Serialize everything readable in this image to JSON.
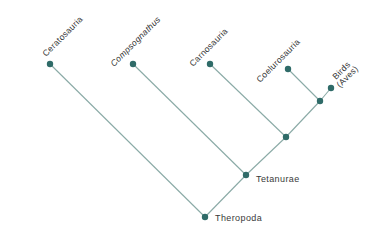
{
  "diagram": {
    "type": "cladogram",
    "colors": {
      "edge": "#8aaaa6",
      "node": "#2f6b68",
      "text": "#333333"
    },
    "tips": [
      {
        "id": "ceratosauria",
        "label": "Ceratosauria",
        "italic": false,
        "x": 50,
        "y": 64
      },
      {
        "id": "compsognathus",
        "label": "Compsognathus",
        "italic": true,
        "x": 133,
        "y": 64
      },
      {
        "id": "carnosauria",
        "label": "Carnosauria",
        "italic": false,
        "x": 210,
        "y": 64
      },
      {
        "id": "coelurosauria",
        "label": "Coelurosauria",
        "italic": false,
        "x": 288,
        "y": 69
      },
      {
        "id": "birds",
        "label": "Birds",
        "label2": "(Aves)",
        "italic": false,
        "x": 331,
        "y": 88
      }
    ],
    "internal_nodes": [
      {
        "id": "coel-birds",
        "label": "",
        "x": 320,
        "y": 101
      },
      {
        "id": "carno-clade",
        "label": "",
        "x": 286,
        "y": 137
      },
      {
        "id": "tetanurae",
        "label": "Tetanurae",
        "x": 246,
        "y": 175
      },
      {
        "id": "theropoda",
        "label": "Theropoda",
        "x": 205,
        "y": 217
      }
    ],
    "edges": [
      [
        "ceratosauria",
        "theropoda"
      ],
      [
        "tetanurae",
        "theropoda"
      ],
      [
        "compsognathus",
        "tetanurae"
      ],
      [
        "carno-clade",
        "tetanurae"
      ],
      [
        "carnosauria",
        "carno-clade"
      ],
      [
        "coel-birds",
        "carno-clade"
      ],
      [
        "coelurosauria",
        "coel-birds"
      ],
      [
        "birds",
        "coel-birds"
      ]
    ]
  }
}
